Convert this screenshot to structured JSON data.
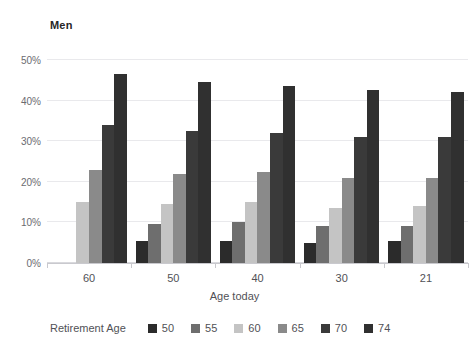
{
  "chart_data": {
    "type": "bar",
    "title": "Men",
    "xlabel": "Age today",
    "ylabel": "",
    "categories": [
      "60",
      "50",
      "40",
      "30",
      "21"
    ],
    "series": [
      {
        "name": "50",
        "color": "#2b2b2b",
        "values": [
          null,
          5.5,
          5.5,
          5.0,
          5.5
        ]
      },
      {
        "name": "55",
        "color": "#6e6e6e",
        "values": [
          null,
          9.5,
          10.0,
          9.0,
          9.0
        ]
      },
      {
        "name": "60",
        "color": "#c4c4c4",
        "values": [
          15.0,
          14.5,
          15.0,
          13.5,
          14.0
        ]
      },
      {
        "name": "65",
        "color": "#8a8a8a",
        "values": [
          23.0,
          22.0,
          22.5,
          21.0,
          21.0
        ]
      },
      {
        "name": "70",
        "color": "#3a3a3a",
        "values": [
          34.0,
          32.5,
          32.0,
          31.0,
          31.0
        ]
      },
      {
        "name": "74",
        "color": "#303030",
        "values": [
          46.5,
          44.5,
          43.5,
          42.5,
          42.0
        ]
      }
    ],
    "ylim": [
      0,
      50
    ],
    "y_ticks": [
      "0%",
      "10%",
      "20%",
      "30%",
      "40%",
      "50%"
    ],
    "y_tick_values": [
      0,
      10,
      20,
      30,
      40,
      50
    ],
    "grid": true,
    "legend_position": "bottom-left",
    "legend_title": "Retirement Age",
    "legend_entries": [
      "50",
      "55",
      "60",
      "65",
      "70",
      "74"
    ]
  },
  "colors": {
    "background": "#ffffff",
    "gridline": "#e9e9ec",
    "axis": "#c9c9ce",
    "title_text": "#262626",
    "tick_text": "#6b6b70",
    "label_text": "#515156"
  }
}
